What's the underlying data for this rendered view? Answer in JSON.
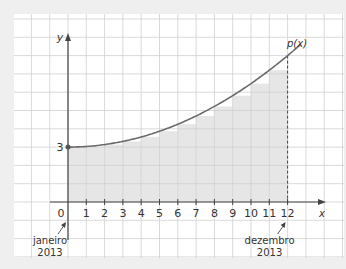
{
  "chart_data": {
    "type": "line",
    "title": "",
    "xlabel": "x",
    "ylabel": "y",
    "curve_label": "p(x)",
    "x_ticks": [
      "0",
      "1",
      "2",
      "3",
      "4",
      "5",
      "6",
      "7",
      "8",
      "9",
      "10",
      "11",
      "12"
    ],
    "y_ticks": [
      "3"
    ],
    "xlim": [
      -3,
      14
    ],
    "ylim": [
      -3,
      10
    ],
    "grid": true,
    "series": [
      {
        "name": "p(x)",
        "x": [
          0,
          1,
          2,
          3,
          4,
          5,
          6,
          7,
          8,
          9,
          10,
          11,
          12,
          12.7
        ],
        "values": [
          3,
          3.03,
          3.14,
          3.31,
          3.56,
          3.87,
          4.25,
          4.7,
          5.22,
          5.81,
          6.47,
          7.2,
          8,
          8.48
        ]
      }
    ],
    "shaded_steps": {
      "description": "Inscribed rectangles under p(x) from x=0 to x=12 (left sum)",
      "x_start": [
        0,
        1,
        2,
        3,
        4,
        5,
        6,
        7,
        8,
        9,
        10,
        11
      ],
      "heights": [
        3,
        3.03,
        3.14,
        3.31,
        3.56,
        3.87,
        4.25,
        4.7,
        5.22,
        5.81,
        6.47,
        7.2
      ]
    },
    "marked_point": {
      "x": 0,
      "y": 3,
      "label": "3"
    },
    "dashed_line": {
      "x": 12,
      "from_y": 0,
      "to_y": 8
    },
    "annotations": [
      {
        "at_x": 0,
        "line1": "janeiro",
        "line2": "2013"
      },
      {
        "at_x": 12,
        "line1": "dezembro",
        "line2": "2013"
      }
    ],
    "colors": {
      "curve": "#6a6a6a",
      "axis": "#444444",
      "grid": "#cfcfcf",
      "shade": "#e6e6e6",
      "background": "#ffffff"
    }
  }
}
